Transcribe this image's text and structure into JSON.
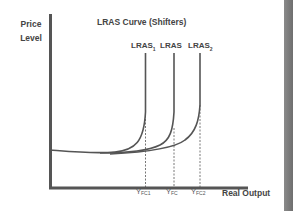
{
  "diagram": {
    "title": "LRAS Curve (Shifters)",
    "y_axis_label_line1": "Price",
    "y_axis_label_line2": "Level",
    "x_axis_label": "Real Output",
    "curves": [
      {
        "label": "LRAS",
        "sub": "1",
        "x": 145
      },
      {
        "label": "LRAS",
        "sub": "",
        "x": 174
      },
      {
        "label": "LRAS",
        "sub": "2",
        "x": 200
      }
    ],
    "ticks": [
      {
        "label": "Y",
        "sub": "FC1"
      },
      {
        "label": "Y",
        "sub": "FC"
      },
      {
        "label": "Y",
        "sub": "FC2"
      }
    ],
    "colors": {
      "axis": "#555555",
      "curve": "#555555",
      "text": "#444444",
      "edge_bar": "#7a7a7a"
    }
  }
}
